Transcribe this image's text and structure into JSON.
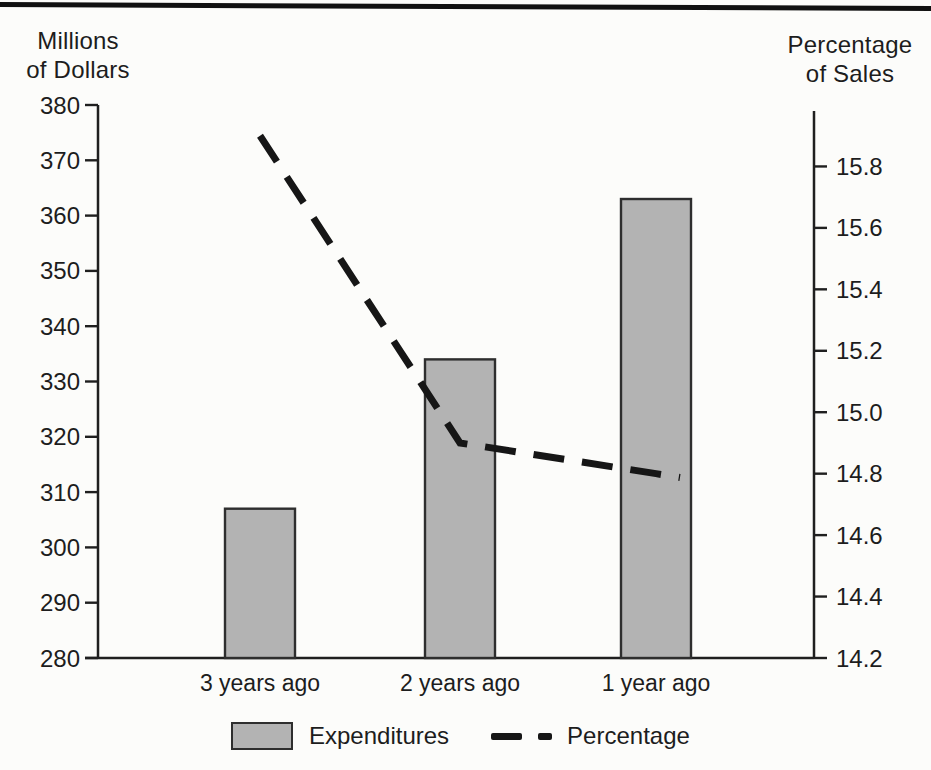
{
  "colors": {
    "background": "#fcfcfa",
    "top_rule": "#111111",
    "axis": "#1f1f1f",
    "text": "#1d1d1d",
    "bar_fill": "#b3b3b3",
    "bar_border": "#2e2e2e",
    "line": "#161616"
  },
  "chart_data": {
    "type": "bar+line combo",
    "categories": [
      "3 years ago",
      "2 years ago",
      "1 year ago"
    ],
    "series": [
      {
        "name": "Expenditures",
        "type": "bar",
        "axis": "left",
        "unit": "millions of dollars",
        "values": [
          307,
          334,
          363
        ]
      },
      {
        "name": "Percentage",
        "type": "line",
        "style": "dashed",
        "axis": "right",
        "unit": "percent of sales",
        "values": [
          15.9,
          14.9,
          14.8
        ]
      }
    ],
    "left_axis": {
      "title_lines": [
        "Millions",
        "of Dollars"
      ],
      "min": 280,
      "max": 380,
      "tick_step": 10,
      "tick_labels": [
        "380",
        "370",
        "360",
        "350",
        "340",
        "330",
        "320",
        "310",
        "300",
        "290",
        "280"
      ]
    },
    "right_axis": {
      "title_lines": [
        "Percentage",
        "of Sales"
      ],
      "min": 14.2,
      "max": 16.0,
      "tick_step": 0.2,
      "tick_labels": [
        "15.8",
        "15.6",
        "15.4",
        "15.2",
        "15.0",
        "14.8",
        "14.6",
        "14.4",
        "14.2"
      ]
    },
    "legend": {
      "position": "bottom",
      "items": [
        {
          "label": "Expenditures",
          "swatch": "gray-bar"
        },
        {
          "label": "Percentage",
          "swatch": "dashed-line"
        }
      ]
    },
    "grid": false
  }
}
